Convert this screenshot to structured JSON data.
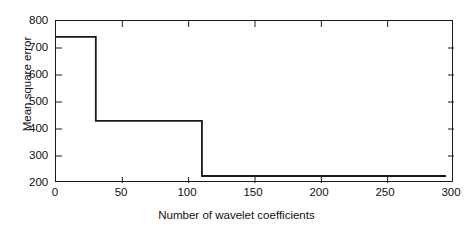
{
  "chart_data": {
    "type": "line",
    "title": "",
    "xlabel": "Number of wavelet coefficients",
    "ylabel": "Mean square error",
    "xlim": [
      0,
      300
    ],
    "ylim": [
      200,
      800
    ],
    "xticks": [
      0,
      50,
      100,
      150,
      200,
      250,
      300
    ],
    "yticks": [
      200,
      300,
      400,
      500,
      600,
      700,
      800
    ],
    "grid": false,
    "legend": null,
    "line_color": "#1a1a1a",
    "background_color": "#ffffff",
    "step_style": "post",
    "series": [
      {
        "name": "Mean square error",
        "x": [
          0,
          30,
          30,
          110,
          110,
          294
        ],
        "y": [
          741,
          741,
          430,
          430,
          226,
          226
        ]
      }
    ],
    "steps": [
      {
        "x_start": 0,
        "x_end": 30,
        "value": 741
      },
      {
        "x_start": 30,
        "x_end": 110,
        "value": 430
      },
      {
        "x_start": 110,
        "x_end": 294,
        "value": 226
      }
    ]
  },
  "axes": {
    "y_tick_labels": [
      "800",
      "700",
      "600",
      "500",
      "400",
      "300",
      "200"
    ],
    "x_tick_labels": [
      "0",
      "50",
      "100",
      "150",
      "200",
      "250",
      "300"
    ],
    "x_axis_title": "Number of wavelet coefficients",
    "y_axis_title": "Mean square error"
  }
}
